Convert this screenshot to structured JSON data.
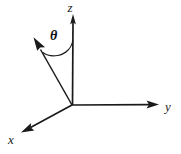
{
  "figure": {
    "background_color": "#ffffff",
    "line_color": "#1a1a1a",
    "width": 181,
    "height": 154,
    "origin": {
      "x": 72,
      "y": 105
    },
    "labels": {
      "z_axis": "z",
      "y_axis": "y",
      "x_axis": "x",
      "angle": "θ"
    },
    "label_positions": {
      "z_axis": {
        "x": 74,
        "y": 11
      },
      "y_axis": {
        "x": 168,
        "y": 106
      },
      "x_axis": {
        "x": 12,
        "y": 140
      },
      "angle": {
        "x": 55,
        "y": 39
      }
    },
    "axes": [
      {
        "name": "z-axis",
        "label": "z",
        "from": {
          "x": 72,
          "y": 105
        },
        "to": {
          "x": 73,
          "y": 16
        },
        "arrow": true
      },
      {
        "name": "y-axis",
        "label": "y",
        "from": {
          "x": 72,
          "y": 105
        },
        "to": {
          "x": 158,
          "y": 105
        },
        "arrow": true
      },
      {
        "name": "x-axis",
        "label": "x",
        "from": {
          "x": 72,
          "y": 105
        },
        "to": {
          "x": 23,
          "y": 131
        },
        "arrow": true
      }
    ],
    "vector": {
      "name": "direction-ray",
      "from": {
        "x": 72,
        "y": 105
      },
      "to": {
        "x": 35,
        "y": 40
      },
      "arrow": true
    },
    "angle_arc": {
      "name": "theta-arc",
      "symbol": "θ",
      "from": {
        "x": 73,
        "y": 41
      },
      "to": {
        "x": 44,
        "y": 50
      },
      "measured_between": [
        "z-axis",
        "direction-ray"
      ]
    }
  }
}
